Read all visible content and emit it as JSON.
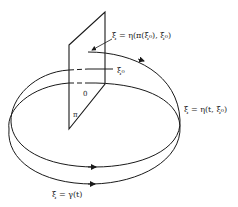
{
  "figure": {
    "type": "poincare-map-diagram",
    "labels": {
      "return_point": "ξ = η(π(ξ₀), ξ₀)",
      "initial_point": "ξ₀",
      "origin": "0",
      "section": "π",
      "trajectory": "ξ = η(t, ξ₀)",
      "periodic_orbit": "ξ = γ(t)"
    },
    "colors": {
      "ink": "#1a1a1a",
      "background": "#ffffff"
    }
  }
}
